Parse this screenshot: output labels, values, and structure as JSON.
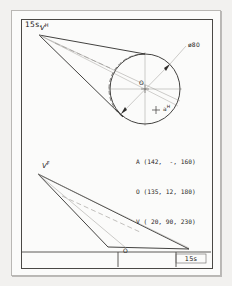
{
  "sheet": {
    "number_top_left": "15s.",
    "title_block_number": "15s"
  },
  "top_view": {
    "apex_label": "V",
    "apex_super": "H",
    "center_label": "O",
    "point_label": "a",
    "point_super": "H",
    "diameter_label": "ø80"
  },
  "front_view": {
    "apex_label": "V",
    "apex_super": "F",
    "base_label": "O"
  },
  "coordinates": {
    "lines": [
      "A (142,  -, 160)",
      "O (135, 12, 180)",
      "V ( 20, 90, 230)"
    ],
    "line_1": "A (142,  -, 160)",
    "line_2": "O (135, 12, 180)",
    "line_3": "V ( 20, 90, 230)"
  },
  "colors": {
    "outline": "#2e2c2a",
    "construction": "#9b9894",
    "paper": "#fbfbfa",
    "background": "#f2f1ef",
    "frame": "#4a4845"
  }
}
